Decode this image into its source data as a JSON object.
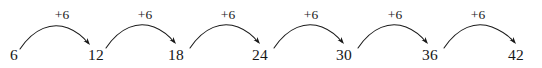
{
  "figure": {
    "background_color": "#ffffff",
    "ink_color": "#1a1a1a",
    "width": 542,
    "height": 68
  },
  "chart_data": {
    "type": "line",
    "subtitle": "",
    "xlabel": "",
    "ylabel": "",
    "grid": false,
    "legend": null,
    "orientation": "horizontal",
    "step": 6,
    "start": 6,
    "end": 42,
    "categories": [
      "6",
      "12",
      "18",
      "24",
      "30",
      "36",
      "42"
    ],
    "values": [
      6,
      12,
      18,
      24,
      30,
      36,
      42
    ],
    "x": [
      6,
      12,
      18,
      24,
      30,
      36,
      42
    ],
    "annotations": [
      "+6",
      "+6",
      "+6",
      "+6",
      "+6",
      "+6"
    ]
  },
  "nodes": [
    {
      "label": "6",
      "cx": 14,
      "baseline": 62
    },
    {
      "label": "12",
      "cx": 96,
      "baseline": 62
    },
    {
      "label": "18",
      "cx": 176,
      "baseline": 62
    },
    {
      "label": "24",
      "cx": 260,
      "baseline": 62
    },
    {
      "label": "30",
      "cx": 344,
      "baseline": 62
    },
    {
      "label": "36",
      "cx": 430,
      "baseline": 62
    },
    {
      "label": "42",
      "cx": 516,
      "baseline": 62
    }
  ],
  "jumps": [
    {
      "label": "+6",
      "cx": 62,
      "top": 8,
      "path": "M 20 49 C 34 28, 52 22, 68 28 C 78 32, 84 38, 88 43",
      "arrow_x": 90,
      "arrow_y": 45,
      "arrow_angle": 52
    },
    {
      "label": "+6",
      "cx": 145,
      "top": 8,
      "path": "M 106 48 C 120 27, 138 21, 154 27 C 164 31, 170 37, 174 42",
      "arrow_x": 176,
      "arrow_y": 44,
      "arrow_angle": 52
    },
    {
      "label": "+6",
      "cx": 228,
      "top": 8,
      "path": "M 190 48 C 204 27, 222 21, 238 27 C 248 31, 254 37, 258 42",
      "arrow_x": 260,
      "arrow_y": 44,
      "arrow_angle": 52
    },
    {
      "label": "+6",
      "cx": 311,
      "top": 8,
      "path": "M 274 48 C 288 27, 306 21, 322 27 C 332 31, 338 37, 342 42",
      "arrow_x": 344,
      "arrow_y": 44,
      "arrow_angle": 52
    },
    {
      "label": "+6",
      "cx": 395,
      "top": 8,
      "path": "M 358 48 C 372 27, 390 21, 406 27 C 416 31, 422 37, 426 42",
      "arrow_x": 428,
      "arrow_y": 44,
      "arrow_angle": 52
    },
    {
      "label": "+6",
      "cx": 478,
      "top": 8,
      "path": "M 444 48 C 458 27, 476 21, 492 27 C 502 31, 510 37, 514 42",
      "arrow_x": 516,
      "arrow_y": 44,
      "arrow_angle": 52
    }
  ]
}
